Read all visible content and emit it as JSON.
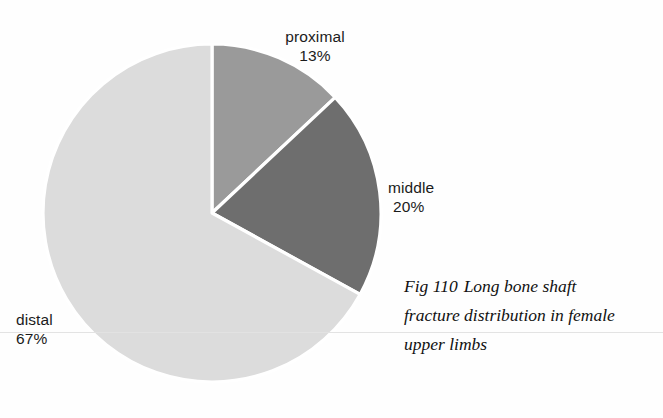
{
  "chart_data": {
    "type": "pie",
    "title": "",
    "categories": [
      "proximal",
      "middle",
      "distal"
    ],
    "values": [
      13,
      20,
      67
    ],
    "unit": "%",
    "labels": [
      "proximal 13%",
      "middle 20%",
      "distal 67%"
    ],
    "colors": [
      "#9a9a9a",
      "#6e6e6e",
      "#dcdcdc"
    ],
    "slice_order": "clockwise from 12 o'clock",
    "legend": "none (direct slice labels)",
    "grid": false,
    "xlabel": "",
    "ylabel": ""
  },
  "pie": {
    "center_x": 212,
    "center_y": 213,
    "radius": 169,
    "divider_color": "#ffffff",
    "background": "#fefefe",
    "slices": [
      {
        "name": "proximal",
        "label": "proximal",
        "value_label": "13%",
        "value": 13,
        "color": "#9a9a9a",
        "start_deg": 0,
        "end_deg": 46.8
      },
      {
        "name": "middle",
        "label": "middle",
        "value_label": "20%",
        "value": 20,
        "color": "#6e6e6e",
        "start_deg": 46.8,
        "end_deg": 118.8
      },
      {
        "name": "distal",
        "label": "distal",
        "value_label": "67%",
        "value": 67,
        "color": "#dcdcdc",
        "start_deg": 118.8,
        "end_deg": 360
      }
    ]
  },
  "caption": {
    "figure_number": "Fig 110",
    "line1_rest": "Long bone shaft",
    "line2": "fracture distribution in female",
    "line3": "upper limbs",
    "full_text": "Fig 110 Long bone shaft fracture distribution in female upper limbs"
  }
}
